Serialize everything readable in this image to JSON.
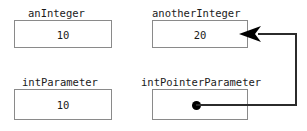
{
  "diagram": {
    "type": "memory-layout",
    "width": 307,
    "height": 131,
    "background_color": "#ffffff",
    "box_border_color": "#8a8a8a",
    "text_color": "#1a1a1a",
    "link_color": "#2b2b2b",
    "dot_color": "#000000",
    "variables": [
      {
        "id": "an-integer",
        "label": "anInteger",
        "value": "10",
        "kind": "int",
        "label_x": 28,
        "label_y": 7,
        "box_x": 14,
        "box_y": 20,
        "box_w": 98,
        "box_h": 28,
        "value_x": 14,
        "value_y": 29,
        "value_w": 98
      },
      {
        "id": "another-integer",
        "label": "anotherInteger",
        "value": "20",
        "kind": "int",
        "label_x": 152,
        "label_y": 7,
        "box_x": 152,
        "box_y": 20,
        "box_w": 96,
        "box_h": 28,
        "value_x": 152,
        "value_y": 29,
        "value_w": 96
      },
      {
        "id": "int-parameter",
        "label": "intParameter",
        "value": "10",
        "kind": "int",
        "label_x": 22,
        "label_y": 76,
        "box_x": 14,
        "box_y": 89,
        "box_w": 98,
        "box_h": 31,
        "value_x": 14,
        "value_y": 99,
        "value_w": 98
      },
      {
        "id": "int-pointer-parameter",
        "label": "intPointerParameter",
        "value": "",
        "kind": "pointer",
        "label_x": 141,
        "label_y": 76,
        "box_x": 152,
        "box_y": 89,
        "box_w": 96,
        "box_h": 31,
        "value_x": 152,
        "value_y": 99,
        "value_w": 96
      }
    ],
    "pointer_link": {
      "from": "int-pointer-parameter",
      "to": "another-integer",
      "dot_x": 192,
      "dot_y": 101,
      "dot_size": 9,
      "segments": [
        {
          "name": "horizontal-from-dot",
          "x": 196,
          "y": 104,
          "w": 101,
          "h": 2
        },
        {
          "name": "vertical-right-riser",
          "x": 295,
          "y": 34,
          "w": 2,
          "h": 72
        },
        {
          "name": "horizontal-into-arrow",
          "x": 258,
          "y": 33,
          "w": 39,
          "h": 2
        }
      ],
      "arrow": {
        "name": "arrow-head-left",
        "x": 238,
        "y": 25,
        "w": 24,
        "h": 18,
        "direction": "left"
      }
    }
  }
}
